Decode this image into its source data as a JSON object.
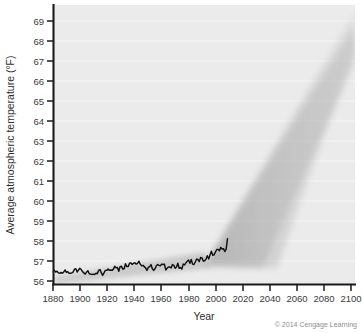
{
  "figure": {
    "credit": "© 2014 Cengage Learning",
    "background_color": "#ffffff",
    "plot_background_color": "#ebebeb",
    "gridline_color": "#f8f8f8",
    "axis_color": "#1a1a1a",
    "line_color": "#111111",
    "projection_color": "#b9b9b9"
  },
  "chart_data": {
    "type": "line",
    "title": "",
    "xlabel": "Year",
    "ylabel": "Average atmospheric temperature (°F)",
    "xlim": [
      1880,
      2105
    ],
    "ylim": [
      56,
      69.4
    ],
    "xticks": [
      1880,
      1900,
      1920,
      1940,
      1960,
      1980,
      2000,
      2020,
      2040,
      2060,
      2080,
      2100
    ],
    "xtick_labels": [
      "1880",
      "1900",
      "1920",
      "1940",
      "1960",
      "1980",
      "2000",
      "2020",
      "2040",
      "2060",
      "2080",
      "2100"
    ],
    "yticks": [
      56,
      57,
      58,
      59,
      60,
      61,
      62,
      63,
      64,
      65,
      66,
      67,
      68,
      69
    ],
    "ytick_labels": [
      "56",
      "57",
      "58",
      "59",
      "60",
      "61",
      "62",
      "63",
      "64",
      "65",
      "66",
      "67",
      "68",
      "69"
    ],
    "grid": true,
    "grid_axis": "y",
    "legend": false,
    "legend_position": "none",
    "series": [
      {
        "name": "Observed global average atmospheric temperature",
        "style": "solid-black-jagged",
        "x": [
          1880,
          1881,
          1882,
          1883,
          1884,
          1885,
          1886,
          1887,
          1888,
          1889,
          1890,
          1891,
          1892,
          1893,
          1894,
          1895,
          1896,
          1897,
          1898,
          1899,
          1900,
          1901,
          1902,
          1903,
          1904,
          1905,
          1906,
          1907,
          1908,
          1909,
          1910,
          1911,
          1912,
          1913,
          1914,
          1915,
          1916,
          1917,
          1918,
          1919,
          1920,
          1921,
          1922,
          1923,
          1924,
          1925,
          1926,
          1927,
          1928,
          1929,
          1930,
          1931,
          1932,
          1933,
          1934,
          1935,
          1936,
          1937,
          1938,
          1939,
          1940,
          1941,
          1942,
          1943,
          1944,
          1945,
          1946,
          1947,
          1948,
          1949,
          1950,
          1951,
          1952,
          1953,
          1954,
          1955,
          1956,
          1957,
          1958,
          1959,
          1960,
          1961,
          1962,
          1963,
          1964,
          1965,
          1966,
          1967,
          1968,
          1969,
          1970,
          1971,
          1972,
          1973,
          1974,
          1975,
          1976,
          1977,
          1978,
          1979,
          1980,
          1981,
          1982,
          1983,
          1984,
          1985,
          1986,
          1987,
          1988,
          1989,
          1990,
          1991,
          1992,
          1993,
          1994,
          1995,
          1996,
          1997,
          1998,
          1999,
          2000,
          2001,
          2002,
          2003,
          2004,
          2005,
          2006,
          2007,
          2008,
          2009,
          2010
        ],
        "values": [
          56.75,
          56.7,
          56.62,
          56.66,
          56.58,
          56.56,
          56.6,
          56.56,
          56.62,
          56.72,
          56.6,
          56.64,
          56.56,
          56.56,
          56.58,
          56.62,
          56.76,
          56.78,
          56.62,
          56.72,
          56.8,
          56.74,
          56.64,
          56.58,
          56.52,
          56.62,
          56.68,
          56.54,
          56.52,
          56.5,
          56.52,
          56.5,
          56.56,
          56.54,
          56.7,
          56.74,
          56.58,
          56.46,
          56.58,
          56.7,
          56.7,
          56.76,
          56.7,
          56.72,
          56.7,
          56.76,
          56.9,
          56.82,
          56.84,
          56.66,
          56.88,
          56.9,
          56.76,
          56.78,
          57.02,
          56.88,
          56.88,
          57.04,
          57.06,
          56.98,
          57.04,
          57.06,
          57.0,
          57.04,
          57.14,
          57.0,
          56.92,
          56.94,
          56.88,
          56.82,
          56.7,
          56.84,
          56.88,
          56.98,
          56.78,
          56.7,
          56.78,
          56.92,
          56.98,
          56.94,
          56.92,
          57.0,
          56.98,
          57.0,
          56.72,
          56.8,
          56.86,
          56.86,
          56.82,
          56.98,
          56.94,
          56.8,
          56.86,
          57.04,
          56.8,
          56.84,
          56.76,
          57.0,
          56.96,
          57.06,
          57.14,
          57.2,
          57.04,
          57.22,
          57.0,
          56.98,
          57.1,
          57.24,
          57.22,
          57.12,
          57.32,
          57.3,
          57.14,
          57.16,
          57.24,
          57.4,
          57.24,
          57.44,
          57.62,
          57.42,
          57.44,
          57.58,
          57.7,
          57.7,
          57.64,
          57.8,
          57.72,
          57.74,
          57.6,
          57.72,
          58.22
        ]
      },
      {
        "name": "Projected warming range (uncertainty cone)",
        "style": "gray-fan",
        "x": [
          2010,
          2030,
          2050,
          2070,
          2090,
          2100
        ],
        "upper": [
          58.3,
          59.9,
          62.0,
          64.6,
          67.6,
          69.4
        ],
        "lower": [
          58.1,
          58.3,
          58.6,
          58.9,
          59.2,
          59.4
        ]
      }
    ],
    "annotations": []
  }
}
